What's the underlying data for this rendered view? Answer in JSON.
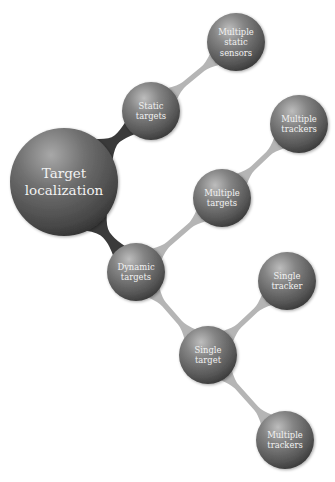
{
  "diagram": {
    "colors": {
      "background": "#ffffff",
      "sphere_highlight": "#b8b8b8",
      "sphere_mid": "#7a7a7a",
      "sphere_dark": "#3e3e3e",
      "connector": "#b5b5b5",
      "connector_root": "#3a3a3a",
      "label": "#f2f2f2"
    },
    "nodes": [
      {
        "id": "root",
        "lines": [
          "Target",
          "localization"
        ],
        "cx": 64,
        "cy": 182,
        "r": 54
      },
      {
        "id": "static-targets",
        "lines": [
          "Static",
          "targets"
        ],
        "cx": 151,
        "cy": 111,
        "r": 29
      },
      {
        "id": "multiple-static-sensors",
        "lines": [
          "Multiple",
          "static",
          "sensors"
        ],
        "cx": 236,
        "cy": 42,
        "r": 29
      },
      {
        "id": "dynamic-targets",
        "lines": [
          "Dynamic",
          "targets"
        ],
        "cx": 136,
        "cy": 272,
        "r": 29
      },
      {
        "id": "multiple-targets",
        "lines": [
          "Multiple",
          "targets"
        ],
        "cx": 222,
        "cy": 198,
        "r": 29
      },
      {
        "id": "multiple-trackers-top",
        "lines": [
          "Multiple",
          "trackers"
        ],
        "cx": 299,
        "cy": 124,
        "r": 29
      },
      {
        "id": "single-target",
        "lines": [
          "Single",
          "target"
        ],
        "cx": 208,
        "cy": 355,
        "r": 29
      },
      {
        "id": "single-tracker",
        "lines": [
          "Single",
          "tracker"
        ],
        "cx": 287,
        "cy": 281,
        "r": 29
      },
      {
        "id": "multiple-trackers-bottom",
        "lines": [
          "Multiple",
          "trackers"
        ],
        "cx": 285,
        "cy": 440,
        "r": 29
      }
    ],
    "edges": [
      {
        "from": "root",
        "to": "static-targets"
      },
      {
        "from": "root",
        "to": "dynamic-targets"
      },
      {
        "from": "static-targets",
        "to": "multiple-static-sensors"
      },
      {
        "from": "dynamic-targets",
        "to": "multiple-targets"
      },
      {
        "from": "multiple-targets",
        "to": "multiple-trackers-top"
      },
      {
        "from": "dynamic-targets",
        "to": "single-target"
      },
      {
        "from": "single-target",
        "to": "single-tracker"
      },
      {
        "from": "single-target",
        "to": "multiple-trackers-bottom"
      }
    ]
  }
}
